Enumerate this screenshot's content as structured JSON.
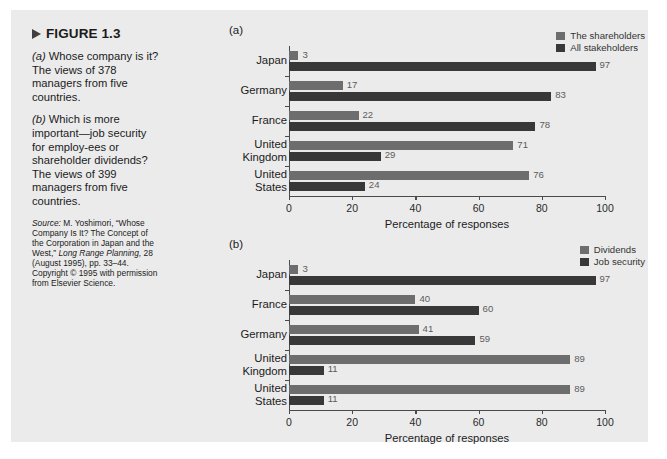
{
  "figure": {
    "label": "FIGURE 1.3",
    "marker_icon": "triangle-right-icon",
    "caption_a_prefix": "(a)",
    "caption_a": " Whose company is it? The views of 378 managers from five countries.",
    "caption_b_prefix": "(b)",
    "caption_b": " Which is more important—job security for employ-ees or shareholder dividends? The views of 399 managers from five countries.",
    "source_label": "Source:",
    "source_text_1": " M. Yoshimori, “Whose Company Is It? The Concept of the Corporation in Japan and the West,” ",
    "source_italic_journal": "Long Range Planning,",
    "source_text_2": " 28 (August 1995), pp. 33–44. Copyright © 1995 with permission from Elsevier Science."
  },
  "colors": {
    "panel_background": "#ebebeb",
    "page_background": "#ffffff",
    "series_light": "#6d6d6d",
    "series_dark": "#383838",
    "axis": "#4a4a4a",
    "value_label": "#5c5c5c",
    "text": "#1b1b1b"
  },
  "chart_data": [
    {
      "id": "a",
      "type": "bar",
      "orientation": "horizontal",
      "panel_label": "(a)",
      "title": "",
      "xlabel": "Percentage of responses",
      "ylabel": "",
      "xlim": [
        0,
        100
      ],
      "xticks": [
        0,
        20,
        40,
        60,
        80,
        100
      ],
      "xtick_labels": [
        "0",
        "20",
        "40",
        "60",
        "80",
        "100"
      ],
      "grid": false,
      "legend_position": "top-right",
      "categories": [
        "Japan",
        "Germany",
        "France",
        "United Kingdom",
        "United States"
      ],
      "series": [
        {
          "name": "The shareholders",
          "color": "#6d6d6d",
          "values": [
            3,
            17,
            22,
            71,
            76
          ]
        },
        {
          "name": "All stakeholders",
          "color": "#383838",
          "values": [
            97,
            83,
            78,
            29,
            24
          ]
        }
      ]
    },
    {
      "id": "b",
      "type": "bar",
      "orientation": "horizontal",
      "panel_label": "(b)",
      "title": "",
      "xlabel": "Percentage of responses",
      "ylabel": "",
      "xlim": [
        0,
        100
      ],
      "xticks": [
        0,
        20,
        40,
        60,
        80,
        100
      ],
      "xtick_labels": [
        "0",
        "20",
        "40",
        "60",
        "80",
        "100"
      ],
      "grid": false,
      "legend_position": "top-right",
      "categories": [
        "Japan",
        "France",
        "Germany",
        "United Kingdom",
        "United States"
      ],
      "series": [
        {
          "name": "Dividends",
          "color": "#6d6d6d",
          "values": [
            3,
            40,
            41,
            89,
            89
          ]
        },
        {
          "name": "Job security",
          "color": "#383838",
          "values": [
            97,
            60,
            59,
            11,
            11
          ]
        }
      ]
    }
  ]
}
